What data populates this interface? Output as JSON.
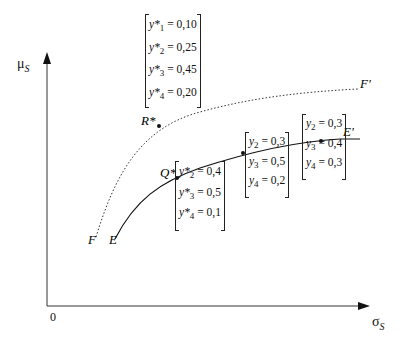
{
  "axes": {
    "y_label": "μ",
    "y_label_sub": "S",
    "x_label": "σ",
    "x_label_sub": "S",
    "origin": "0"
  },
  "curves": {
    "FF": {
      "start_label": "F",
      "end_label": "F'",
      "style": "dotted"
    },
    "EE": {
      "start_label": "E",
      "end_label": "E'",
      "style": "solid"
    }
  },
  "points": {
    "R": "R*",
    "Q": "Q*"
  },
  "matrices": {
    "R_weights": [
      {
        "var": "y*",
        "idx": "1",
        "val": "= 0,10"
      },
      {
        "var": "y*",
        "idx": "2",
        "val": "= 0,25"
      },
      {
        "var": "y*",
        "idx": "3",
        "val": "= 0,45"
      },
      {
        "var": "y*",
        "idx": "4",
        "val": "= 0,20"
      }
    ],
    "Q_weights": [
      {
        "var": "y*",
        "idx": "2",
        "val": "= 0,4"
      },
      {
        "var": "y*",
        "idx": "3",
        "val": "= 0,5"
      },
      {
        "var": "y*",
        "idx": "4",
        "val": "= 0,1"
      }
    ],
    "mid_weights": [
      {
        "var": "y",
        "idx": "2",
        "val": "= 0,3"
      },
      {
        "var": "y",
        "idx": "3",
        "val": "= 0,5"
      },
      {
        "var": "y",
        "idx": "4",
        "val": "= 0,2"
      }
    ],
    "right_weights": [
      {
        "var": "y",
        "idx": "2",
        "val": "= 0,3"
      },
      {
        "var": "y",
        "idx": "3",
        "val": "= 0,4"
      },
      {
        "var": "y",
        "idx": "4",
        "val": "= 0,3"
      }
    ]
  }
}
